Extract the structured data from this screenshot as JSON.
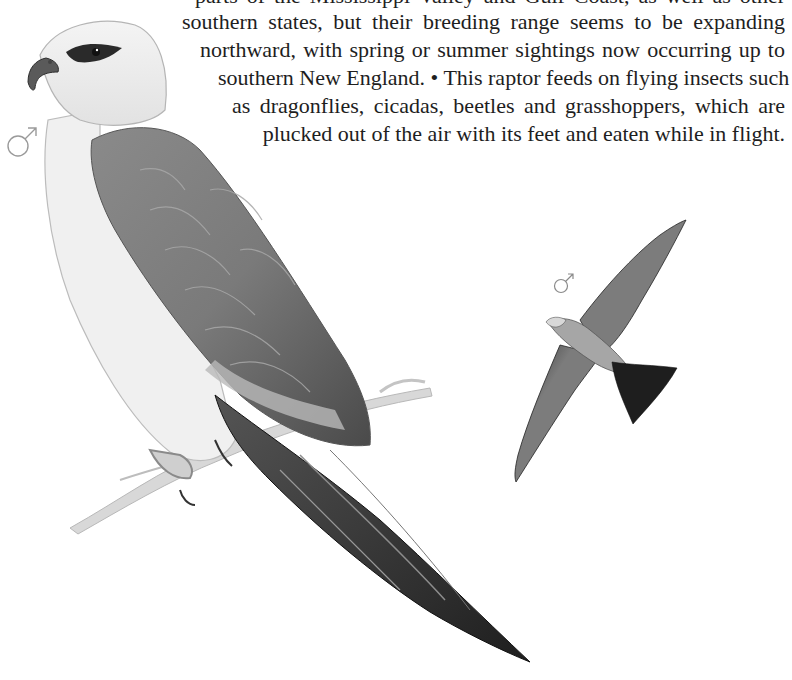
{
  "page": {
    "background": "#ffffff",
    "text_color": "#1e1e1e"
  },
  "body_text": {
    "lines": [
      {
        "text": "parts of the Mississippi Valley and Gulf Coast, as well as other",
        "left": 195,
        "top": -18
      },
      {
        "text": "southern states, but their breeding range seems to be expanding",
        "left": 182,
        "top": 8
      },
      {
        "text": "northward, with spring or summer sightings now occurring up to",
        "left": 200,
        "top": 36
      },
      {
        "text": "southern New England. • This raptor feeds on flying insects such",
        "left": 218,
        "top": 64
      },
      {
        "text": "as dragonflies, cicadas, beetles and grasshoppers, which are",
        "left": 232,
        "top": 92
      },
      {
        "text": "plucked out of the air with its feet and eaten while in flight.",
        "left": 242,
        "top": 120
      }
    ]
  },
  "illustrations": {
    "perched_bird": {
      "label": "perched-kite-illustration",
      "sex": "male"
    },
    "flying_bird": {
      "label": "flying-kite-illustration",
      "sex": "male"
    }
  },
  "symbols": {
    "male_glyph": "♂",
    "male_symbol_perched": {
      "x": 6,
      "y": 124,
      "size": 28,
      "color": "#9a9a9a"
    },
    "male_symbol_flying": {
      "x": 553,
      "y": 272,
      "size": 18,
      "color": "#8a8a8a"
    }
  }
}
